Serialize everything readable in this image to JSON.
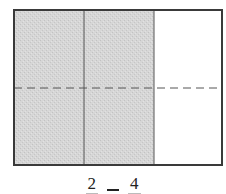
{
  "diagram": {
    "type": "fraction-area-model",
    "columns": 3,
    "rows": 2,
    "shaded_columns": 2,
    "divider_style": {
      "vertical": "solid",
      "horizontal": "dashed"
    },
    "colors": {
      "shaded_fill": "#d4d4d4",
      "unshaded_fill": "#ffffff",
      "border": "#3a3a3a",
      "divider": "#555555"
    }
  },
  "caption": {
    "left_numerator": "2",
    "operator": "=",
    "right_numerator": "4"
  }
}
